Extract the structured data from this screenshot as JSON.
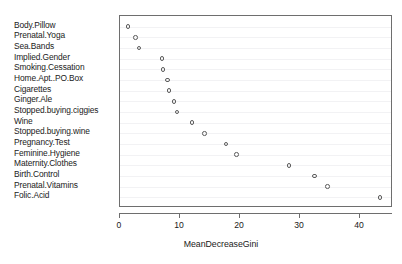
{
  "chart_data": {
    "type": "scatter",
    "title": "",
    "subtitle": "",
    "xlabel": "MeanDecreaseGini",
    "ylabel": "",
    "orientation": "horizontal",
    "grid": true,
    "legend": null,
    "xlim": [
      0,
      45.5
    ],
    "xticks": [
      0,
      10,
      20,
      30,
      40
    ],
    "xticklabels": [
      "0",
      "10",
      "20",
      "30",
      "40"
    ],
    "categories": [
      "Folic.Acid",
      "Prenatal.Vitamins",
      "Birth.Control",
      "Maternity.Clothes",
      "Feminine.Hygiene",
      "Pregnancy.Test",
      "Stopped.buying.wine",
      "Wine",
      "Stopped.buying.ciggies",
      "Ginger.Ale",
      "Cigarettes",
      "Home.Apt..PO.Box",
      "Smoking.Cessation",
      "Implied.Gender",
      "Sea.Bands",
      "Prenatal.Yoga",
      "Body.Pillow"
    ],
    "values": [
      43.3,
      34.6,
      32.4,
      28.2,
      19.4,
      17.7,
      14.1,
      12.0,
      9.5,
      9.0,
      8.2,
      7.9,
      7.2,
      7.0,
      3.2,
      2.6,
      1.3
    ],
    "marker": "open-circle",
    "marker_color": "#5a5a5a",
    "grid_color": "#f2f2f4",
    "axis_color": "#6e6e6e",
    "text_color": "#1a1a1a",
    "background": "#ffffff"
  }
}
